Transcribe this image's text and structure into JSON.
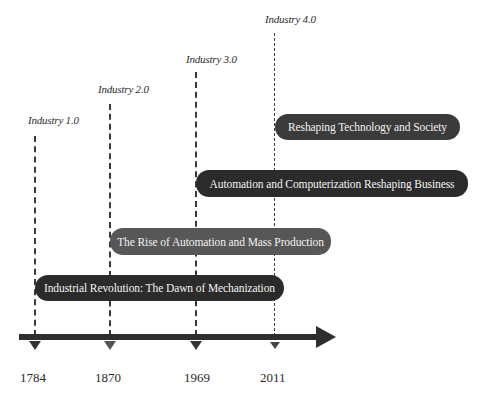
{
  "diagram": {
    "type": "timeline",
    "eras": [
      {
        "label": "Industry 1.0",
        "year": "1784",
        "description": "Industrial Revolution: The Dawn of Mechanization"
      },
      {
        "label": "Industry 2.0",
        "year": "1870",
        "description": "The Rise of Automation and Mass Production"
      },
      {
        "label": "Industry 3.0",
        "year": "1969",
        "description": "Automation and Computerization Reshaping Business"
      },
      {
        "label": "Industry 4.0",
        "year": "2011",
        "description": "Reshaping Technology and Society"
      }
    ],
    "colors": {
      "pill_dark": "#2b2b2b",
      "pill_mid": "#3b3b3b",
      "pill_grey": "#575757",
      "axis": "#2e2e2e",
      "dashes": "#3a3a3a",
      "text": "#2a2a2a"
    }
  }
}
